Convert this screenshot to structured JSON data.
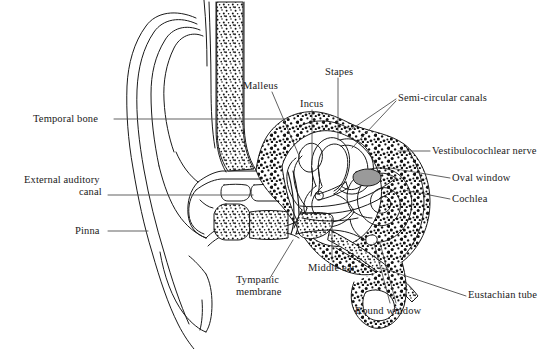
{
  "figure": {
    "type": "anatomical-line-diagram",
    "background_color": "#ffffff",
    "line_color": "#1a1a1a",
    "stipple_color": "#111111",
    "leader_color": "#444444",
    "text_color": "#1a1a1a"
  },
  "labels": [
    {
      "id": "temporal-bone",
      "text": "Temporal bone",
      "x": 33,
      "y": 113,
      "align": "l",
      "leader": [
        [
          114,
          119
        ],
        [
          285,
          119
        ]
      ]
    },
    {
      "id": "external-auditory-canal",
      "text": "External auditory",
      "text2": "canal",
      "x": 24,
      "y": 180,
      "align": "l",
      "leader": [
        [
          108,
          195
        ],
        [
          253,
          195
        ]
      ]
    },
    {
      "id": "pinna",
      "text": "Pinna",
      "x": 75,
      "y": 225,
      "align": "l",
      "leader": [
        [
          108,
          231
        ],
        [
          148,
          231
        ]
      ]
    },
    {
      "id": "malleus",
      "text": "Malleus",
      "x": 243,
      "y": 80,
      "align": "l",
      "leader": [
        [
          272,
          92
        ],
        [
          300,
          158
        ]
      ]
    },
    {
      "id": "incus",
      "text": "Incus",
      "x": 300,
      "y": 98,
      "align": "l",
      "leader": [
        [
          312,
          110
        ],
        [
          312,
          165
        ]
      ]
    },
    {
      "id": "stapes",
      "text": "Stapes",
      "x": 325,
      "y": 66,
      "align": "l",
      "leader": [
        [
          338,
          78
        ],
        [
          338,
          140
        ]
      ]
    },
    {
      "id": "semi-circular-canals",
      "text": "Semi-circular canals",
      "x": 398,
      "y": 92,
      "align": "l",
      "leader": [
        [
          396,
          99
        ],
        [
          346,
          133
        ]
      ]
    },
    {
      "id": "vestibulocochlear-nerve",
      "text": "Vestibulocochlear nerve",
      "x": 432,
      "y": 145,
      "align": "l",
      "leader": [
        [
          430,
          151
        ],
        [
          398,
          151
        ]
      ]
    },
    {
      "id": "oval-window",
      "text": "Oval window",
      "x": 452,
      "y": 172,
      "align": "l",
      "leader": [
        [
          450,
          178
        ],
        [
          390,
          168
        ]
      ]
    },
    {
      "id": "cochlea",
      "text": "Cochlea",
      "x": 452,
      "y": 193,
      "align": "l",
      "leader": [
        [
          450,
          199
        ],
        [
          404,
          190
        ]
      ]
    },
    {
      "id": "tympanic-membrane",
      "text": "Tympanic",
      "text2": "membrane",
      "x": 236,
      "y": 280,
      "align": "l",
      "leader": [
        [
          270,
          278
        ],
        [
          293,
          240
        ]
      ]
    },
    {
      "id": "middle-ear",
      "text": "Middle ear",
      "x": 308,
      "y": 262,
      "align": "l",
      "leader": [
        [
          332,
          260
        ],
        [
          332,
          218
        ]
      ]
    },
    {
      "id": "round-window",
      "text": "Round window",
      "x": 355,
      "y": 305,
      "align": "l",
      "leader": [
        [
          390,
          303
        ],
        [
          374,
          243
        ]
      ]
    },
    {
      "id": "eustachian-tube",
      "text": "Eustachian tube",
      "x": 468,
      "y": 292,
      "align": "l",
      "leader": [
        [
          466,
          296
        ],
        [
          382,
          268
        ]
      ]
    }
  ],
  "structures": [
    {
      "id": "pinna-outline",
      "name": "Pinna (outer ear)"
    },
    {
      "id": "ear-canal",
      "name": "External auditory canal"
    },
    {
      "id": "temporal-bone-mass",
      "name": "Temporal bone (stippled)"
    },
    {
      "id": "tympanic-membrane-line",
      "name": "Tympanic membrane"
    },
    {
      "id": "ossicles",
      "name": "Malleus, incus and stapes"
    },
    {
      "id": "semicircular-canals",
      "name": "Semi-circular canals"
    },
    {
      "id": "cochlea-spiral",
      "name": "Cochlea"
    },
    {
      "id": "vestibulocochlear-nerve-bundle",
      "name": "Vestibulocochlear nerve"
    },
    {
      "id": "eustachian-tube-channel",
      "name": "Eustachian tube"
    },
    {
      "id": "oval-window-patch",
      "name": "Oval window"
    },
    {
      "id": "round-window-patch",
      "name": "Round window"
    }
  ]
}
